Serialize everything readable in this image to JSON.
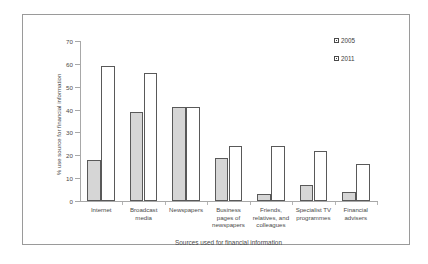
{
  "chart_data": {
    "type": "bar",
    "title": "",
    "subtitle": "",
    "xlabel": "Sources used for financial information",
    "ylabel": "% use source for financial information",
    "ylim": [
      0,
      70
    ],
    "yticks": [
      0,
      10,
      20,
      30,
      40,
      50,
      60,
      70
    ],
    "grid": false,
    "legend_position": "top-right",
    "categories": [
      "Internet",
      "Broadcast media",
      "Newspapers",
      "Business pages of newspapers",
      "Friends, relatives, and colleagues",
      "Specialist TV programmes",
      "Financial advisers"
    ],
    "category_lines": [
      [
        "Internet"
      ],
      [
        "Broadcast",
        "media"
      ],
      [
        "Newspapers"
      ],
      [
        "Business",
        "pages of",
        "newspapers"
      ],
      [
        "Friends,",
        "relatives, and",
        "colleagues"
      ],
      [
        "Specialist TV",
        "programmes"
      ],
      [
        "Financial",
        "advisers"
      ]
    ],
    "series": [
      {
        "name": "2005",
        "color": "#d6d6d6",
        "values": [
          18,
          39,
          41,
          19,
          3,
          7,
          4
        ]
      },
      {
        "name": "2011",
        "color": "#ffffff",
        "values": [
          59,
          56,
          41,
          24,
          24,
          22,
          16
        ]
      }
    ]
  },
  "legend": {
    "items": [
      {
        "label": "2005"
      },
      {
        "label": "2011"
      }
    ]
  },
  "axis": {
    "y_title": "% use source for financial information",
    "x_title": "Sources used for financial information",
    "y_tick_labels": [
      "0",
      "10",
      "20",
      "30",
      "40",
      "50",
      "60",
      "70"
    ]
  }
}
